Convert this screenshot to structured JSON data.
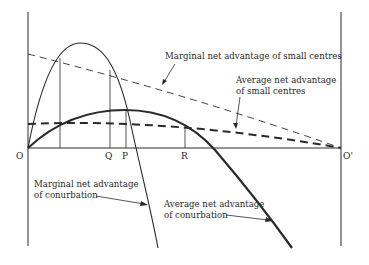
{
  "diagram": {
    "axis_labels": {
      "origin": "O",
      "origin_right": "O'",
      "q": "Q",
      "p": "P",
      "r": "R"
    },
    "curves": {
      "marginal_small": {
        "label_line1": "Marginal net advantage of small centres",
        "style": "thin-dashed"
      },
      "average_small": {
        "label_line1": "Average net advantage",
        "label_line2": "of small centres",
        "style": "thick-dashed"
      },
      "marginal_conurbation": {
        "label_line1": "Marginal net advantage",
        "label_line2": "of conurbation",
        "style": "thin-solid"
      },
      "average_conurbation": {
        "label_line1": "Average net advantage",
        "label_line2": "of conurbation",
        "style": "thick-solid"
      }
    },
    "colors": {
      "ink": "#2a2a2a",
      "background": "#ffffff"
    }
  }
}
